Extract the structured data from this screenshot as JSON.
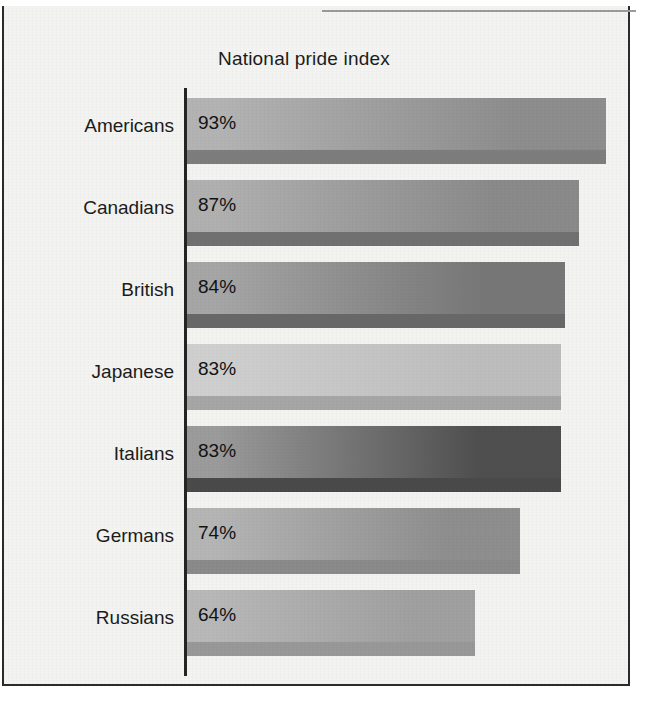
{
  "chart_data": {
    "type": "bar",
    "orientation": "horizontal",
    "title": "National pride index",
    "xlabel": "",
    "ylabel": "",
    "xlim": [
      0,
      100
    ],
    "grid": false,
    "legend": false,
    "unit": "%",
    "categories": [
      "Americans",
      "Canadians",
      "British",
      "Japanese",
      "Italians",
      "Germans",
      "Russians"
    ],
    "values": [
      93,
      87,
      84,
      83,
      83,
      74,
      64
    ],
    "value_labels": [
      "93%",
      "87%",
      "84%",
      "83%",
      "83%",
      "74%",
      "64%"
    ],
    "bars": [
      {
        "category": "Americans",
        "value": 93,
        "label": "93%",
        "fill_light": "#b3b3b3",
        "fill_dark": "#8d8d8d",
        "base": "#7d7d7d"
      },
      {
        "category": "Canadians",
        "value": 87,
        "label": "87%",
        "fill_light": "#b0b0b0",
        "fill_dark": "#8a8a8a",
        "base": "#707070"
      },
      {
        "category": "British",
        "value": 84,
        "label": "84%",
        "fill_light": "#a6a6a6",
        "fill_dark": "#777777",
        "base": "#686868"
      },
      {
        "category": "Japanese",
        "value": 83,
        "label": "83%",
        "fill_light": "#cfcfcf",
        "fill_dark": "#bdbdbd",
        "base": "#a6a6a6"
      },
      {
        "category": "Italians",
        "value": 83,
        "label": "83%",
        "fill_light": "#9b9b9b",
        "fill_dark": "#4f4f4f",
        "base": "#4a4a4a"
      },
      {
        "category": "Germans",
        "value": 74,
        "label": "74%",
        "fill_light": "#b5b5b5",
        "fill_dark": "#8e8e8e",
        "base": "#8a8a8a"
      },
      {
        "category": "Russians",
        "value": 64,
        "label": "64%",
        "fill_light": "#b8b8b8",
        "fill_dark": "#a0a0a0",
        "base": "#989898"
      }
    ]
  },
  "colors": {
    "paper": "#f3f3f1",
    "frame": "#2b2b2b",
    "axis": "#242424",
    "text": "#1b1b1b"
  }
}
